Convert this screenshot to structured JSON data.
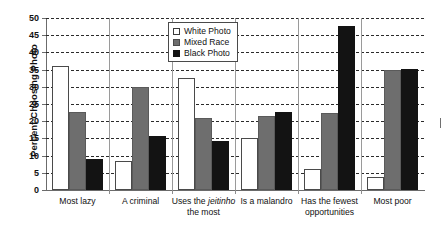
{
  "chart_data": {
    "type": "bar",
    "title": "",
    "xlabel": "",
    "ylabel": "Percent Choosing Photo",
    "ylim": [
      0,
      50
    ],
    "yticks": [
      0,
      5,
      10,
      15,
      20,
      25,
      30,
      35,
      40,
      45,
      50
    ],
    "grid": true,
    "legend_position": "top-center",
    "categories": [
      "Most lazy",
      "A criminal",
      "Uses the jeitinho the most",
      "Is a malandro",
      "Has the fewest opportunities",
      "Most poor"
    ],
    "category_labels": [
      {
        "line1": "Most lazy",
        "line2": "",
        "italic_word": ""
      },
      {
        "line1": "A criminal",
        "line2": "",
        "italic_word": ""
      },
      {
        "line1": "Uses the jeitinho",
        "line2": "the most",
        "italic_word": "jeitinho"
      },
      {
        "line1": "Is a malandro",
        "line2": "",
        "italic_word": ""
      },
      {
        "line1": "Has the fewest",
        "line2": "opportunities",
        "italic_word": ""
      },
      {
        "line1": "Most poor",
        "line2": "",
        "italic_word": ""
      }
    ],
    "series": [
      {
        "name": "White Photo",
        "color": "#ffffff",
        "values": [
          36.0,
          8.3,
          32.5,
          15.2,
          6.0,
          3.7
        ]
      },
      {
        "name": "Mixed Race",
        "color": "#6e6e6e",
        "values": [
          22.8,
          29.9,
          21.0,
          21.5,
          22.5,
          35.0
        ]
      },
      {
        "name": "Black Photo",
        "color": "#131313",
        "values": [
          8.9,
          15.7,
          14.3,
          22.7,
          47.6,
          35.2
        ]
      }
    ]
  },
  "axis": {
    "y_title": "Percent Choosing Photo",
    "y_tick_labels": [
      "50",
      "45",
      "40",
      "35",
      "30",
      "25",
      "20",
      "15",
      "10",
      "5",
      "0"
    ]
  },
  "legend": {
    "items": [
      {
        "label": "White Photo",
        "swatch": "white-photo"
      },
      {
        "label": "Mixed Race",
        "swatch": "mixed-race"
      },
      {
        "label": "Black Photo",
        "swatch": "black-photo"
      }
    ]
  }
}
